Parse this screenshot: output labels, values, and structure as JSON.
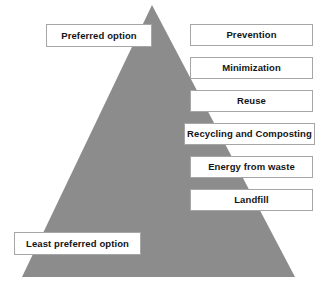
{
  "diagram": {
    "type": "waste-hierarchy-pyramid",
    "background_color": "#FFFFFF",
    "pyramid": {
      "fill_color": "#8C8C8C",
      "apex": [
        152,
        5
      ],
      "base_left": [
        22,
        277
      ],
      "base_right": [
        295,
        277
      ]
    }
  },
  "side_notes": {
    "top": "Preferred option",
    "bottom": "Least preferred option"
  },
  "stages": [
    {
      "label": "Prevention"
    },
    {
      "label": "Minimization"
    },
    {
      "label": "Reuse"
    },
    {
      "label": "Recycling and Composting"
    },
    {
      "label": "Energy from waste"
    },
    {
      "label": "Landfill"
    }
  ],
  "style": {
    "box_fill": "#FFFFFF",
    "box_border": "#A6A6A6",
    "text_color": "#141414"
  }
}
